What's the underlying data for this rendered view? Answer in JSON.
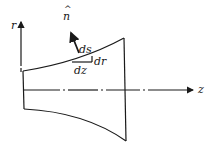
{
  "diagram": {
    "labels": {
      "r_axis": "r",
      "z_axis": "z",
      "normal": "n",
      "normal_hat": "^",
      "ds": "ds",
      "dr": "dr",
      "dz": "dz"
    },
    "colors": {
      "ink": "#1a1a1a",
      "background": "#ffffff"
    }
  }
}
